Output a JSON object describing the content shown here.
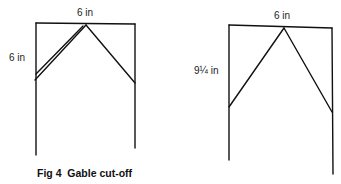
{
  "figure": {
    "caption": "Fig 4  Gable cut-off",
    "panels": [
      {
        "name": "square-gable",
        "width_label": "6 in",
        "height_label": "6 in"
      },
      {
        "name": "tall-gable",
        "width_label": "6 in",
        "height_label": "9¼ in"
      }
    ]
  }
}
